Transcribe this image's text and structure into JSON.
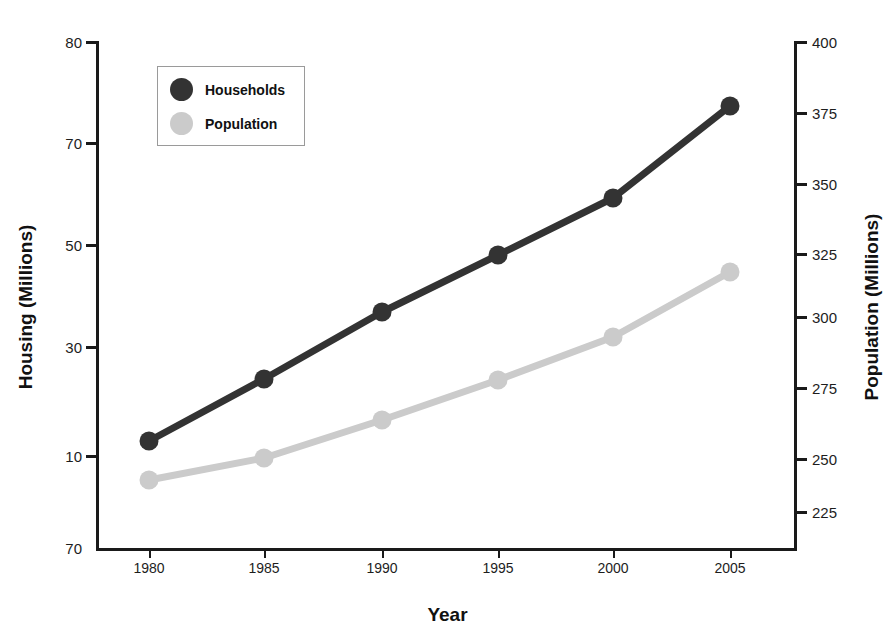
{
  "chart_data": {
    "type": "line",
    "title": "",
    "xlabel": "Year",
    "ylabel": "Housing (Millions)",
    "ylabel_secondary": "Population (Millions)",
    "categories": [
      "1980",
      "1985",
      "1990",
      "1995",
      "2000",
      "2005"
    ],
    "x": [
      1980,
      1985,
      1990,
      1995,
      2000,
      2005
    ],
    "grid": false,
    "legend_position": "top-left",
    "series": [
      {
        "name": "Households",
        "axis": "left",
        "color": "#333333",
        "values": [
          11.5,
          24.5,
          37.5,
          48.5,
          58.0,
          74.0
        ],
        "pixel_y": [
          441,
          379,
          312,
          255,
          198,
          106
        ]
      },
      {
        "name": "Population",
        "axis": "right",
        "color": "#cbcbcb",
        "values": [
          227,
          236,
          251,
          267,
          285,
          296
        ],
        "pixel_y": [
          480,
          458,
          420,
          380,
          337,
          272
        ]
      }
    ],
    "axis_left": {
      "label": "Housing (Millions)",
      "tick_labels": [
        "80",
        "70",
        "50",
        "30",
        "10",
        "70"
      ],
      "tick_pixel_y": [
        42,
        143,
        245,
        347,
        456,
        548
      ]
    },
    "axis_right": {
      "label": "Population (Millions)",
      "tick_labels": [
        "400",
        "375",
        "350",
        "325",
        "300",
        "275",
        "250",
        "225"
      ],
      "tick_pixel_y": [
        42,
        113,
        184,
        254,
        264,
        317,
        388,
        459
      ],
      "ylim": [
        200,
        400
      ]
    },
    "axis_bottom": {
      "label": "Year",
      "tick_labels": [
        "1980",
        "1985",
        "1990",
        "1995",
        "2000",
        "2005"
      ],
      "tick_pixel_x": [
        149,
        264,
        382,
        498,
        613,
        730
      ]
    }
  },
  "legend": {
    "entries": [
      {
        "label": "Households",
        "color": "#333333"
      },
      {
        "label": "Population",
        "color": "#cbcbcb"
      }
    ]
  },
  "colors": {
    "households": "#333333",
    "population": "#cbcbcb",
    "axis": "#1a1a1a",
    "background": "#ffffff"
  }
}
